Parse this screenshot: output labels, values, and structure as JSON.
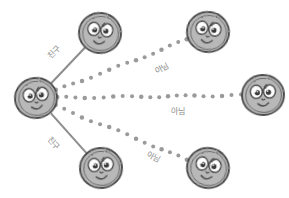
{
  "diagram": {
    "type": "node-link-graph",
    "background_color": "#ffffff",
    "width": 289,
    "height": 198,
    "style": "hand-drawn sketch",
    "palette": {
      "face_fill": "#b8b8b8",
      "face_outline": "#4a4a4a",
      "eye_white": "#ffffff",
      "pupil": "#3a3a3a",
      "solid_edge": "#8f8f8f",
      "dotted_edge": "#9a9a9a",
      "label_text": "#8c8c8c"
    },
    "nodes": [
      {
        "id": "ego",
        "label": "center-face",
        "x": 36,
        "y": 98,
        "rx": 21,
        "ry": 20,
        "expression": "smiling",
        "role": "hub"
      },
      {
        "id": "friend-top",
        "label": "top-left-face",
        "x": 100,
        "y": 33,
        "rx": 21,
        "ry": 20,
        "expression": "smiling",
        "role": "friend"
      },
      {
        "id": "friend-bot",
        "label": "bottom-left-face",
        "x": 101,
        "y": 168,
        "rx": 21,
        "ry": 20,
        "expression": "smiling",
        "role": "friend"
      },
      {
        "id": "other-top",
        "label": "top-right-face",
        "x": 208,
        "y": 32,
        "rx": 21,
        "ry": 20,
        "expression": "smiling",
        "role": "not-friend"
      },
      {
        "id": "other-mid",
        "label": "middle-right-face",
        "x": 263,
        "y": 95,
        "rx": 21,
        "ry": 20,
        "expression": "smiling",
        "role": "not-friend"
      },
      {
        "id": "other-bot",
        "label": "bottom-right-face",
        "x": 208,
        "y": 168,
        "rx": 21,
        "ry": 20,
        "expression": "smiling",
        "role": "not-friend"
      }
    ],
    "edges": [
      {
        "id": "e1",
        "from": "ego",
        "to": "friend-top",
        "style": "solid",
        "label": "친구",
        "label_x": 53,
        "label_y": 52,
        "label_rotation": -46
      },
      {
        "id": "e2",
        "from": "ego",
        "to": "friend-bot",
        "style": "solid",
        "label": "친구",
        "label_x": 54,
        "label_y": 143,
        "label_rotation": 46
      },
      {
        "id": "e3",
        "from": "ego",
        "to": "other-top",
        "style": "dotted",
        "label": "아님",
        "label_x": 161,
        "label_y": 68,
        "label_rotation": -29
      },
      {
        "id": "e4",
        "from": "ego",
        "to": "other-mid",
        "style": "dotted",
        "label": "아님",
        "label_x": 178,
        "label_y": 110,
        "label_rotation": 0
      },
      {
        "id": "e5",
        "from": "ego",
        "to": "other-bot",
        "style": "dotted",
        "label": "아님",
        "label_x": 154,
        "label_y": 156,
        "label_rotation": 29
      }
    ],
    "legend": {
      "solid_meaning": "친구",
      "dotted_meaning": "아님"
    }
  }
}
